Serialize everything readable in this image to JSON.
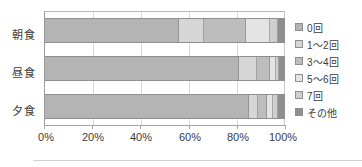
{
  "chart_data": {
    "type": "bar",
    "subtype": "stacked-horizontal-100-percent",
    "title": "",
    "xlabel": "",
    "ylabel": "",
    "categories": [
      "朝食",
      "昼食",
      "夕食"
    ],
    "xticks": [
      "0%",
      "20%",
      "40%",
      "60%",
      "80%",
      "100%"
    ],
    "xtick_values": [
      0,
      20,
      40,
      60,
      80,
      100
    ],
    "xlim": [
      0,
      100
    ],
    "grid": true,
    "legend_position": "right",
    "series": [
      {
        "name": "0回",
        "color": "#b4b4b4",
        "values": [
          56.0,
          81.0,
          85.5
        ]
      },
      {
        "name": "1～2回",
        "color": "#d6d6d6",
        "values": [
          10.5,
          7.5,
          3.5
        ]
      },
      {
        "name": "3～4回",
        "color": "#bdbdbd",
        "values": [
          17.5,
          5.5,
          4.0
        ]
      },
      {
        "name": "5～6回",
        "color": "#e4e4e4",
        "values": [
          10.0,
          2.5,
          2.5
        ]
      },
      {
        "name": "7回",
        "color": "#cfcfcf",
        "values": [
          3.5,
          1.5,
          2.0
        ]
      },
      {
        "name": "その他",
        "color": "#8f8f8f",
        "values": [
          2.5,
          2.0,
          2.5
        ]
      }
    ]
  },
  "legend": {
    "items": [
      {
        "label": "0回",
        "color": "#b4b4b4"
      },
      {
        "label": "1～2回",
        "color": "#d6d6d6"
      },
      {
        "label": "3～4回",
        "color": "#bdbdbd"
      },
      {
        "label": "5～6回",
        "color": "#e4e4e4"
      },
      {
        "label": "7回",
        "color": "#cfcfcf"
      },
      {
        "label": "その他",
        "color": "#8f8f8f"
      }
    ]
  },
  "colors": {
    "plot_background": "#ffffff",
    "axis_line": "#a6a6a6",
    "gridline": "#d8d8d8",
    "bar_border": "#8f8f8f",
    "text": "#3b3b3b"
  }
}
